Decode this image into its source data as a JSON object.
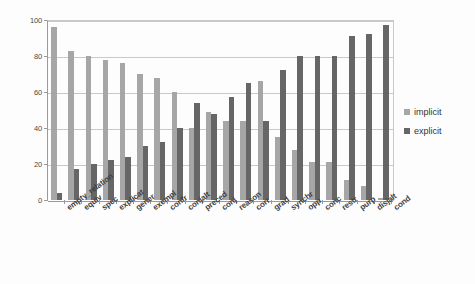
{
  "chart_data": {
    "type": "bar",
    "title": "",
    "subtitle": "",
    "xlabel": "",
    "ylabel": "",
    "ylim": [
      0,
      100
    ],
    "yticks": [
      0,
      20,
      40,
      60,
      80,
      100
    ],
    "ytick_labels": [
      "0",
      "20",
      "40",
      "60",
      "80",
      "100"
    ],
    "grid": true,
    "legend_position": "right",
    "categories": [
      "empty_relation",
      "equiv",
      "spec",
      "explicat",
      "gener",
      "exempl",
      "confr",
      "conjalt",
      "preced",
      "conj",
      "reason",
      "corr",
      "grad",
      "synchr",
      "opp",
      "conc",
      "restr",
      "purp",
      "disjalt",
      "cond"
    ],
    "series": [
      {
        "name": "implicit",
        "color": "#a6a6a6",
        "values": [
          96,
          83,
          80,
          78,
          76,
          70,
          68,
          60,
          40,
          49,
          44,
          44,
          66,
          35,
          28,
          21,
          21,
          11,
          8,
          1
        ]
      },
      {
        "name": "explicit",
        "color": "#666666",
        "values": [
          4,
          17,
          20,
          22,
          24,
          30,
          32,
          40,
          54,
          48,
          57,
          65,
          44,
          72,
          80,
          80,
          80,
          91,
          92,
          97
        ]
      }
    ]
  },
  "legend": {
    "items": [
      {
        "label": "implicit",
        "color": "#a6a6a6"
      },
      {
        "label": "explicit",
        "color": "#666666"
      }
    ]
  }
}
